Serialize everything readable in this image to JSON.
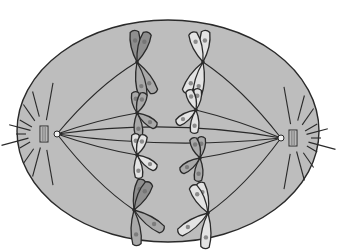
{
  "diagram": {
    "canvas": {
      "width": 343,
      "height": 250
    },
    "colors": {
      "background": "#ffffff",
      "cytoplasm": "#bdbdbd",
      "outline": "#2a2a2a",
      "chromatid_dark": "#8e8e8e",
      "chromatid_mid": "#a9a9a9",
      "chromatid_light": "#e3e3e3",
      "band": "#6e6e6e",
      "centriole_fill": "#d8d8d8",
      "aster": "#2a2a2a"
    },
    "cell": {
      "cx": 168,
      "cy": 131,
      "rx": 151,
      "ry": 111
    },
    "poles": [
      {
        "name": "left-pole",
        "centrosome": {
          "x": 57,
          "y": 134
        },
        "centriole": {
          "x": 44,
          "y": 134
        }
      },
      {
        "name": "right-pole",
        "centrosome": {
          "x": 281,
          "y": 138
        },
        "centriole": {
          "x": 293,
          "y": 138
        }
      }
    ],
    "chromosomes": [
      {
        "side": "left",
        "centromere": {
          "x": 137,
          "y": 62
        },
        "shade": "dark"
      },
      {
        "side": "left",
        "centromere": {
          "x": 137,
          "y": 113
        },
        "shade": "mid"
      },
      {
        "side": "left",
        "centromere": {
          "x": 137,
          "y": 155
        },
        "shade": "light"
      },
      {
        "side": "left",
        "centromere": {
          "x": 134,
          "y": 210
        },
        "shade": "dark"
      },
      {
        "side": "right",
        "centromere": {
          "x": 203,
          "y": 62
        },
        "shade": "light"
      },
      {
        "side": "right",
        "centromere": {
          "x": 196,
          "y": 110
        },
        "shade": "light"
      },
      {
        "side": "right",
        "centromere": {
          "x": 200,
          "y": 158
        },
        "shade": "mid"
      },
      {
        "side": "right",
        "centromere": {
          "x": 208,
          "y": 213
        },
        "shade": "light"
      }
    ],
    "labels": []
  }
}
